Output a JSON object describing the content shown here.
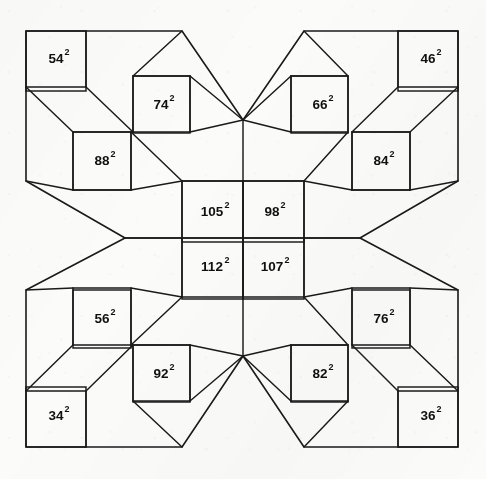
{
  "figure": {
    "exponent": "2",
    "stroke_color": "#1a1a1a",
    "fill_color": "#fbfbfa",
    "background_color": "#fbfbfa",
    "canvas": {
      "width": 486,
      "height": 479
    }
  },
  "chart_data": {
    "type": "diagram",
    "title": "",
    "squares": [
      {
        "id": "sq-54",
        "label": "54",
        "exponent": "2",
        "value": 54,
        "x": 26,
        "y": 31,
        "size": 60,
        "quadrant": "top-left",
        "label_cx": 56,
        "label_cy": 58
      },
      {
        "id": "sq-74",
        "label": "74",
        "exponent": "2",
        "value": 74,
        "x": 133,
        "y": 76,
        "size": 57,
        "quadrant": "top-left",
        "label_cx": 161,
        "label_cy": 104
      },
      {
        "id": "sq-88",
        "label": "88",
        "exponent": "2",
        "value": 88,
        "x": 73,
        "y": 132,
        "size": 58,
        "quadrant": "top-left",
        "label_cx": 102,
        "label_cy": 160
      },
      {
        "id": "sq-66",
        "label": "66",
        "exponent": "2",
        "value": 66,
        "x": 291,
        "y": 76,
        "size": 57,
        "quadrant": "top-right",
        "label_cx": 320,
        "label_cy": 104
      },
      {
        "id": "sq-46",
        "label": "46",
        "exponent": "2",
        "value": 46,
        "x": 398,
        "y": 31,
        "size": 60,
        "quadrant": "top-right",
        "label_cx": 428,
        "label_cy": 58
      },
      {
        "id": "sq-84",
        "label": "84",
        "exponent": "2",
        "value": 84,
        "x": 352,
        "y": 132,
        "size": 58,
        "quadrant": "top-right",
        "label_cx": 381,
        "label_cy": 160
      },
      {
        "id": "sq-105",
        "label": "105",
        "exponent": "2",
        "value": 105,
        "x": 182,
        "y": 181,
        "size": 61,
        "quadrant": "center",
        "label_cx": 212,
        "label_cy": 211
      },
      {
        "id": "sq-98",
        "label": "98",
        "exponent": "2",
        "value": 98,
        "x": 243,
        "y": 181,
        "size": 61,
        "quadrant": "center",
        "label_cx": 272,
        "label_cy": 211
      },
      {
        "id": "sq-112",
        "label": "112",
        "exponent": "2",
        "value": 112,
        "x": 182,
        "y": 238,
        "size": 61,
        "quadrant": "center",
        "label_cx": 212,
        "label_cy": 266
      },
      {
        "id": "sq-107",
        "label": "107",
        "exponent": "2",
        "value": 107,
        "x": 243,
        "y": 238,
        "size": 61,
        "quadrant": "center",
        "label_cx": 272,
        "label_cy": 266
      },
      {
        "id": "sq-56",
        "label": "56",
        "exponent": "2",
        "value": 56,
        "x": 73,
        "y": 290,
        "size": 58,
        "quadrant": "bottom-left",
        "label_cx": 102,
        "label_cy": 318
      },
      {
        "id": "sq-92",
        "label": "92",
        "exponent": "2",
        "value": 92,
        "x": 133,
        "y": 345,
        "size": 57,
        "quadrant": "bottom-left",
        "label_cx": 161,
        "label_cy": 373
      },
      {
        "id": "sq-34",
        "label": "34",
        "exponent": "2",
        "value": 34,
        "x": 26,
        "y": 387,
        "size": 60,
        "quadrant": "bottom-left",
        "label_cx": 56,
        "label_cy": 415
      },
      {
        "id": "sq-76",
        "label": "76",
        "exponent": "2",
        "value": 76,
        "x": 352,
        "y": 290,
        "size": 58,
        "quadrant": "bottom-right",
        "label_cx": 381,
        "label_cy": 318
      },
      {
        "id": "sq-82",
        "label": "82",
        "exponent": "2",
        "value": 82,
        "x": 291,
        "y": 345,
        "size": 57,
        "quadrant": "bottom-right",
        "label_cx": 320,
        "label_cy": 373
      },
      {
        "id": "sq-36",
        "label": "36",
        "exponent": "2",
        "value": 36,
        "x": 398,
        "y": 387,
        "size": 60,
        "quadrant": "bottom-right",
        "label_cx": 428,
        "label_cy": 415
      }
    ],
    "outline_points": "26,31 182,31 243,120 304,31 458,31 458,181 360,238 458,290 458,447 304,447 243,356 182,447 26,447 26,290 125,238 26,181",
    "internal_edges": [
      "M 86,31 L 86,87 L 26,87",
      "M 86,87 L 133,132",
      "M 182,31 L 133,76",
      "M 133,76 L 190,76 L 190,132 L 133,132 L 133,76",
      "M 73,132 L 131,132 L 131,190 L 73,190 L 73,132",
      "M 73,132 L 26,87",
      "M 73,190 L 26,181",
      "M 131,190 L 182,181",
      "M 190,132 L 243,120",
      "M 190,76 L 243,120",
      "M 131,132 L 182,181",
      "M 125,238 L 182,238",
      "M 398,31 L 398,87 L 458,87",
      "M 398,87 L 352,132",
      "M 304,31 L 348,76",
      "M 348,76 L 291,76 L 291,132 L 348,132 L 348,76",
      "M 410,132 L 352,132 L 352,190 L 410,190 L 410,132",
      "M 410,132 L 458,87",
      "M 410,190 L 458,181",
      "M 352,190 L 304,181",
      "M 291,132 L 243,120",
      "M 291,76 L 243,120",
      "M 348,132 L 304,181",
      "M 360,238 L 304,238",
      "M 86,447 L 86,391 L 26,391",
      "M 86,391 L 133,345",
      "M 182,447 L 133,401",
      "M 133,401 L 190,401 L 190,345 L 133,345 L 133,401",
      "M 73,345 L 131,345 L 131,288 L 73,288 L 73,345",
      "M 73,345 L 26,391",
      "M 73,288 L 26,290",
      "M 131,288 L 182,297",
      "M 190,345 L 243,356",
      "M 190,401 L 243,356",
      "M 131,345 L 182,297",
      "M 398,447 L 398,391 L 458,391",
      "M 398,391 L 352,345",
      "M 304,447 L 348,401",
      "M 348,401 L 291,401 L 291,345 L 348,345 L 348,401",
      "M 410,345 L 352,345 L 352,288 L 410,288 L 410,345",
      "M 410,345 L 458,391",
      "M 410,288 L 458,290",
      "M 352,288 L 304,297",
      "M 291,345 L 243,356",
      "M 291,401 L 243,356",
      "M 348,345 L 304,297",
      "M 182,181 L 304,181 L 304,297 L 182,297 L 182,181",
      "M 182,238 L 304,238",
      "M 243,181 L 243,297",
      "M 243,120 L 243,181",
      "M 243,297 L 243,356",
      "M 125,238 L 182,238",
      "M 304,238 L 360,238"
    ]
  }
}
